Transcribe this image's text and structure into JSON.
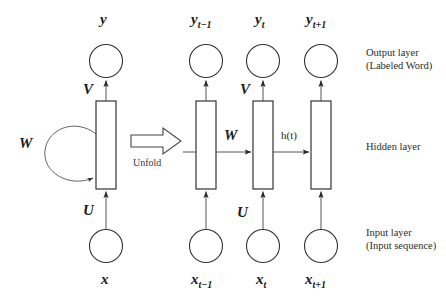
{
  "figure": {
    "stroke_color": "#333333",
    "text_color": "#1a1a1a",
    "background": "#ffffff"
  },
  "folded": {
    "output_node_label": "y",
    "input_node_label": "x",
    "weight_output_label": "V",
    "weight_input_label": "U",
    "weight_recurrent_label": "W"
  },
  "transition": {
    "caption": "Unfold",
    "arrow_icon": "right-arrow-icon"
  },
  "unfolded": {
    "weight_output_label": "V",
    "weight_input_label": "U",
    "weight_recurrent_label": "W",
    "hidden_state_label": "h(t)",
    "timesteps": [
      {
        "output": "y",
        "output_sub": "t−1",
        "input": "x",
        "input_sub": "t−1"
      },
      {
        "output": "y",
        "output_sub": "t",
        "input": "x",
        "input_sub": "t"
      },
      {
        "output": "y",
        "output_sub": "t+1",
        "input": "x",
        "input_sub": "t+1"
      }
    ]
  },
  "layer_annotations": {
    "output": {
      "line1": "Output layer",
      "line2": "(Labeled Word)"
    },
    "hidden": {
      "line1": "Hidden layer",
      "line2": ""
    },
    "input": {
      "line1": "Input layer",
      "line2": "(Input sequence)"
    }
  }
}
